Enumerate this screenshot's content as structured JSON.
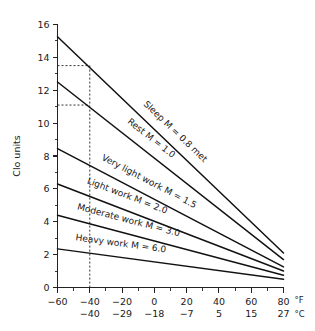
{
  "chart_data": {
    "type": "line",
    "title": "",
    "xlabel": "",
    "ylabel": "Clo units",
    "xlim": [
      -60,
      80
    ],
    "ylim": [
      0,
      16
    ],
    "grid": false,
    "legend": "inline-labels",
    "x_unit_primary": "°F",
    "x_unit_secondary": "°C",
    "x_ticks_f": [
      -60,
      -40,
      -20,
      0,
      20,
      40,
      60,
      80
    ],
    "x_ticklabels_f": [
      "−60",
      "−40",
      "−20",
      "0",
      "20",
      "40",
      "60",
      "80"
    ],
    "x_ticklabels_c": [
      "−40",
      "−29",
      "−18",
      "−7",
      "5",
      "15",
      "27"
    ],
    "x_ticks_c_at_f": [
      -40,
      -20,
      0,
      20,
      40,
      60,
      80
    ],
    "x_minor_step": 10,
    "y_ticks": [
      0,
      2,
      4,
      6,
      8,
      10,
      12,
      14,
      16
    ],
    "y_ticklabels": [
      "0",
      "2",
      "4",
      "6",
      "8",
      "10",
      "12",
      "14",
      "16"
    ],
    "y_minor_ticks": [
      1,
      3,
      5,
      7,
      9,
      11,
      13,
      15
    ],
    "series": [
      {
        "name": "Sleep M = 0.8 met",
        "label": "Sleep M = 0.8 met",
        "activity": "Sleep",
        "met": 0.8,
        "x": [
          -60,
          80
        ],
        "values": [
          15.25,
          2.1
        ]
      },
      {
        "name": "Rest M = 1.0",
        "label": "Rest M = 1.0",
        "activity": "Rest",
        "met": 1.0,
        "x": [
          -60,
          80
        ],
        "values": [
          12.5,
          1.7
        ]
      },
      {
        "name": "Very light work M = 1.5",
        "label": "Very light work M = 1.5",
        "activity": "Very light work",
        "met": 1.5,
        "x": [
          -60,
          80
        ],
        "values": [
          8.45,
          1.25
        ]
      },
      {
        "name": "Light work M = 2.0",
        "label": "Light work M = 2.0",
        "activity": "Light work",
        "met": 2.0,
        "x": [
          -60,
          80
        ],
        "values": [
          6.3,
          1.0
        ]
      },
      {
        "name": "Moderate work M = 3.0",
        "label": "Moderate work M = 3.0",
        "activity": "Moderate work",
        "met": 3.0,
        "x": [
          -60,
          80
        ],
        "values": [
          4.4,
          0.75
        ]
      },
      {
        "name": "Heavy work M = 6.0",
        "label": "Heavy work M = 6.0",
        "activity": "Heavy work",
        "met": 6.0,
        "x": [
          -60,
          80
        ],
        "values": [
          2.35,
          0.5
        ]
      }
    ],
    "annotations": [
      {
        "name": "reference-sleep",
        "type": "dashed-guide",
        "x": -40,
        "y": 13.5,
        "note": "Sleep line read at −40 °F"
      },
      {
        "name": "reference-rest",
        "type": "dashed-guide",
        "x": -40,
        "y": 11.1,
        "note": "Rest line read at −40 °F"
      }
    ]
  },
  "colors": {
    "line": "#111111",
    "axis": "#222222",
    "reference": "#333333",
    "background": "#ffffff"
  }
}
